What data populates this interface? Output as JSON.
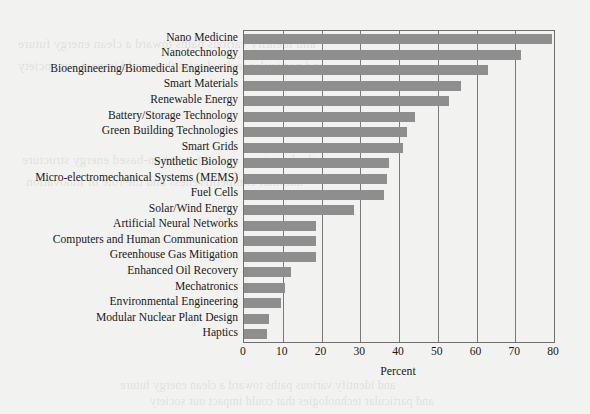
{
  "figure": {
    "background_color": "#f2f2f0",
    "bar_color": "#8e8e8e",
    "axis_color": "#6f6f6f",
    "text_color": "#1a1a1a"
  },
  "chart_data": {
    "type": "bar",
    "orientation": "horizontal",
    "title": "",
    "xlabel": "Percent",
    "ylabel": "",
    "xlim": [
      0,
      80
    ],
    "xticks": [
      0,
      10,
      20,
      30,
      40,
      50,
      60,
      70,
      80
    ],
    "xtick_labels": [
      "0",
      "10",
      "20",
      "30",
      "40",
      "50",
      "60",
      "70",
      "80"
    ],
    "grid": true,
    "grid_axis": "x",
    "legend": false,
    "categories": [
      "Nano Medicine",
      "Nanotechnology",
      "Bioengineering/Biomedical Engineering",
      "Smart Materials",
      "Renewable Energy",
      "Battery/Storage Technology",
      "Green Building Technologies",
      "Smart Grids",
      "Synthetic Biology",
      "Micro-electromechanical Systems (MEMS)",
      "Fuel Cells",
      "Solar/Wind Energy",
      "Artificial Neural Networks",
      "Computers and Human Communication",
      "Greenhouse Gas Mitigation",
      "Enhanced Oil Recovery",
      "Mechatronics",
      "Environmental Engineering",
      "Modular Nuclear Plant Design",
      "Haptics"
    ],
    "values": [
      79.5,
      71.5,
      63,
      56,
      53,
      44,
      42,
      41,
      37.5,
      37,
      36,
      28.5,
      18.5,
      18.5,
      18.5,
      12,
      10.5,
      9.5,
      6.5,
      6
    ]
  },
  "page_bleed": {
    "lines": [
      "and identify various paths toward a clean energy future",
      "and particular technologies that could impact our society",
      "the long-term costs of a carbon-based energy structure",
      "national competitiveness and the role of innovation"
    ]
  }
}
